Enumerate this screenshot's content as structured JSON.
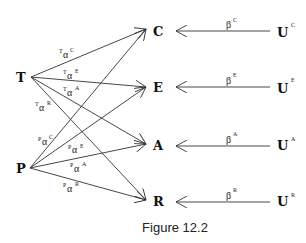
{
  "diagram": {
    "caption": "Figure 12.2",
    "sources": [
      {
        "id": "T",
        "label": "T",
        "x": 31,
        "y": 77
      },
      {
        "id": "P",
        "label": "P",
        "x": 30,
        "y": 168
      }
    ],
    "targets": [
      {
        "id": "C",
        "label": "C",
        "x": 150,
        "y": 33
      },
      {
        "id": "E",
        "label": "E",
        "x": 150,
        "y": 89
      },
      {
        "id": "A",
        "label": "A",
        "x": 150,
        "y": 146
      },
      {
        "id": "R",
        "label": "R",
        "x": 150,
        "y": 202
      }
    ],
    "utilities": [
      {
        "id": "UC",
        "label": "U",
        "sup": "C",
        "target": "C"
      },
      {
        "id": "UE",
        "label": "U",
        "sup": "E",
        "target": "E"
      },
      {
        "id": "UA",
        "label": "U",
        "sup": "A",
        "target": "A"
      },
      {
        "id": "UR",
        "label": "U",
        "sup": "R",
        "target": "R"
      }
    ],
    "alpha_edges": [
      {
        "from": "T",
        "to": "C",
        "pre": "T",
        "sym": "α",
        "sup": "C"
      },
      {
        "from": "T",
        "to": "E",
        "pre": "T",
        "sym": "α",
        "sup": "E"
      },
      {
        "from": "T",
        "to": "A",
        "pre": "T",
        "sym": "α",
        "sup": "A"
      },
      {
        "from": "T",
        "to": "R",
        "pre": "T",
        "sym": "α",
        "sup": "R"
      },
      {
        "from": "P",
        "to": "C",
        "pre": "P",
        "sym": "α",
        "sup": "C"
      },
      {
        "from": "P",
        "to": "E",
        "pre": "P",
        "sym": "α",
        "sup": "E"
      },
      {
        "from": "P",
        "to": "A",
        "pre": "P",
        "sym": "α",
        "sup": "A"
      },
      {
        "from": "P",
        "to": "R",
        "pre": "P",
        "sym": "α",
        "sup": "R"
      }
    ],
    "beta_edges": [
      {
        "from": "UC",
        "to": "C",
        "sym": "β",
        "sup": "C"
      },
      {
        "from": "UE",
        "to": "E",
        "sym": "β",
        "sup": "E"
      },
      {
        "from": "UA",
        "to": "A",
        "sym": "β",
        "sup": "A"
      },
      {
        "from": "UR",
        "to": "R",
        "sym": "β",
        "sup": "R"
      }
    ]
  }
}
